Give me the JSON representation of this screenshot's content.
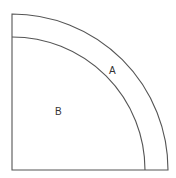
{
  "diagram": {
    "type": "quarter-circle-regions",
    "labels": {
      "region_outer_band": "A",
      "region_inner_quarter": "B"
    },
    "colors": {
      "stroke": "#555555",
      "background": "#ffffff"
    }
  }
}
